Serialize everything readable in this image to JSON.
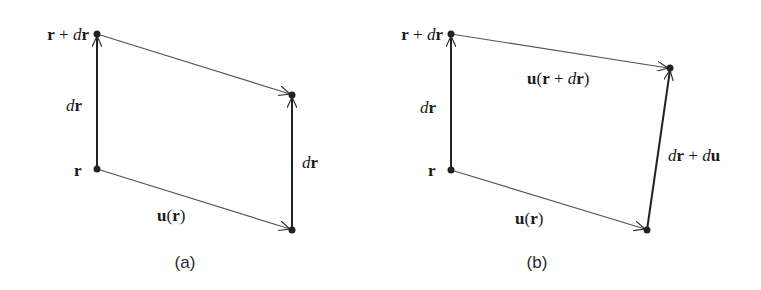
{
  "figure": {
    "panels": [
      {
        "id": "a",
        "caption": "(a)",
        "points": {
          "r": [
            97,
            169
          ],
          "r_plus_dr": [
            97,
            34
          ],
          "top_right": [
            292,
            95
          ],
          "bottom_right": [
            292,
            230
          ]
        },
        "labels": {
          "r_plus_dr": {
            "bold1": "r",
            "plus": " + ",
            "ital": "d",
            "bold2": "r"
          },
          "left_dr": {
            "ital": "d",
            "bold": "r"
          },
          "r": {
            "bold": "r"
          },
          "u_r": {
            "bold_u": "u",
            "open": "(",
            "bold_r": "r",
            "close": ")"
          },
          "right_dr": {
            "ital": "d",
            "bold": "r"
          }
        }
      },
      {
        "id": "b",
        "caption": "(b)",
        "points": {
          "r": [
            451,
            170
          ],
          "r_plus_dr": [
            451,
            34
          ],
          "top_right": [
            670,
            68
          ],
          "bottom_right": [
            647,
            230
          ]
        },
        "labels": {
          "r_plus_dr": {
            "bold1": "r",
            "plus": " + ",
            "ital": "d",
            "bold2": "r"
          },
          "left_dr": {
            "ital": "d",
            "bold": "r"
          },
          "r": {
            "bold": "r"
          },
          "u_r_plus_dr": {
            "bold_u": "u",
            "open": "(",
            "bold_r": "r",
            "plus": " + ",
            "ital": "d",
            "bold_r2": "r",
            "close": ")"
          },
          "u_r": {
            "bold_u": "u",
            "open": "(",
            "bold_r": "r",
            "close": ")"
          },
          "dr_plus_du": {
            "ital1": "d",
            "bold1": "r",
            "plus": " + ",
            "ital2": "d",
            "bold2": "u"
          }
        }
      }
    ]
  }
}
